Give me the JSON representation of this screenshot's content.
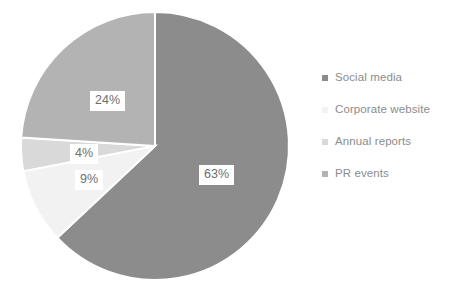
{
  "chart_data": {
    "type": "pie",
    "title": "",
    "labels": [
      "Social media",
      "Corporate website",
      "Annual reports",
      "PR events"
    ],
    "values": [
      63,
      9,
      4,
      24
    ],
    "value_labels": [
      "63%",
      "9%",
      "4%",
      "24%"
    ],
    "colors": [
      "#8c8c8c",
      "#f2f2f2",
      "#d9d9d9",
      "#b3b3b3"
    ],
    "unit": "%",
    "start_angle_deg": 0,
    "direction": "clockwise",
    "legend_position": "right",
    "grid": false,
    "background": "#ffffff",
    "label_text_color": "#6e6e6e",
    "legend_text_color": "#8c8c8c",
    "slices": [
      {
        "label": "Social media",
        "value": 63,
        "value_label": "63%",
        "color": "#8c8c8c"
      },
      {
        "label": "Corporate website",
        "value": 9,
        "value_label": "9%",
        "color": "#f2f2f2"
      },
      {
        "label": "Annual reports",
        "value": 4,
        "value_label": "4%",
        "color": "#d9d9d9"
      },
      {
        "label": "PR events",
        "value": 24,
        "value_label": "24%",
        "color": "#b3b3b3"
      }
    ]
  },
  "legend": {
    "items": [
      {
        "label": "Social media",
        "color": "#8c8c8c"
      },
      {
        "label": "Corporate website",
        "color": "#f2f2f2"
      },
      {
        "label": "Annual reports",
        "color": "#d9d9d9"
      },
      {
        "label": "PR events",
        "color": "#b3b3b3"
      }
    ]
  },
  "geometry": {
    "center_x": 155,
    "center_y": 146,
    "radius": 134,
    "label_positions": [
      {
        "x": 199,
        "y": 165
      },
      {
        "x": 75,
        "y": 170
      },
      {
        "x": 70,
        "y": 144
      },
      {
        "x": 90,
        "y": 91
      }
    ]
  }
}
